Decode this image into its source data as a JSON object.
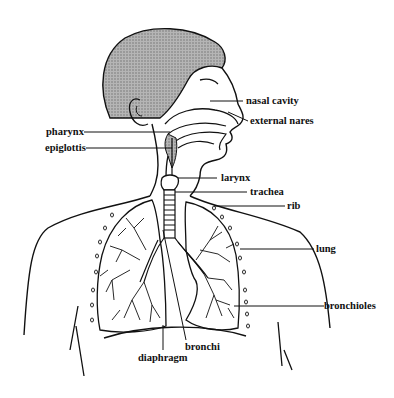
{
  "diagram": {
    "colors": {
      "line": "#111111",
      "hair_fill": "#9a9a9a",
      "background": "#ffffff"
    },
    "labels": {
      "nasal_cavity": "nasal cavity",
      "external_nares": "external nares",
      "pharynx": "pharynx",
      "epiglottis": "epiglottis",
      "larynx": "larynx",
      "trachea": "trachea",
      "rib": "rib",
      "lung": "lung",
      "bronchioles": "bronchioles",
      "bronchi": "bronchi",
      "diaphragm": "diaphragm"
    }
  }
}
